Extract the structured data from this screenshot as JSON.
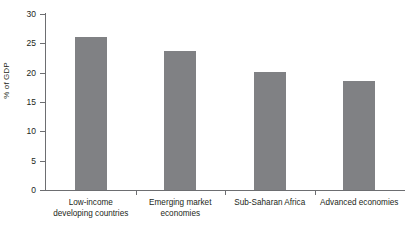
{
  "chart_data": {
    "type": "bar",
    "title": "",
    "xlabel": "",
    "ylabel": "% of GDP",
    "categories": [
      "Low-income developing countries",
      "Emerging market economies",
      "Sub-Saharan Africa",
      "Advanced economies"
    ],
    "category_lines": [
      [
        "Low-income",
        "developing countries"
      ],
      [
        "Emerging market",
        "economies"
      ],
      [
        "Sub-Saharan Africa",
        ""
      ],
      [
        "Advanced economies",
        ""
      ]
    ],
    "values": [
      26.1,
      23.7,
      20.2,
      18.6
    ],
    "ylim": [
      0,
      30
    ],
    "yticks": [
      0,
      5,
      10,
      15,
      20,
      25,
      30
    ],
    "ytick_labels": [
      "0",
      "5",
      "10",
      "15",
      "20",
      "25",
      "30"
    ],
    "grid": false,
    "legend": "none",
    "bar_color": "#808184",
    "axis_color": "#6d6e71",
    "text_color": "#231f20",
    "background": "#ffffff"
  }
}
